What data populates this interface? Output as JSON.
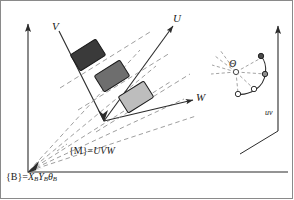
{
  "figure": {
    "background_color": "#ffffff",
    "line_color": "#2b2b2b",
    "dashed_color": "#8c8c8c",
    "border_color": "#8a8a8a",
    "width": 294,
    "height": 200
  },
  "labels": {
    "axis_v": "V",
    "axis_u": "U",
    "axis_w": "W",
    "frame_m_prefix": "{M}",
    "frame_m_equals": "=",
    "frame_m_value": "UVW",
    "frame_b_prefix": "{B}",
    "frame_b_equals": "=",
    "frame_b_x": "X",
    "frame_b_x_sub": "B",
    "frame_b_y": "Y",
    "frame_b_y_sub": "B",
    "frame_b_theta": "θ",
    "frame_b_theta_sub": "B",
    "theta_angle": "Θ",
    "inset_axis": "uv"
  },
  "base_frame": {
    "name": "{B}",
    "origin": [
      28,
      172
    ],
    "vertical_axis_tip": [
      28,
      20
    ],
    "horizontal_axis_tip": [
      286,
      172
    ],
    "fan_ray_count": 5,
    "fan_ray_endpoints": [
      [
        136,
        54
      ],
      [
        150,
        70
      ],
      [
        164,
        86
      ],
      [
        178,
        102
      ],
      [
        192,
        118
      ]
    ]
  },
  "moving_frame": {
    "name": "{M}",
    "axes": "UVW",
    "origin": [
      103,
      119
    ],
    "u_axis_tip": [
      172,
      22
    ],
    "v_axis_tip": [
      60,
      29
    ],
    "w_axis_tip": [
      196,
      101
    ],
    "corridor_dashed_lines": 3
  },
  "blocks": [
    {
      "index": 1,
      "label": "block-1",
      "fill": "#3a3a3a",
      "center": [
        88,
        55
      ],
      "width": 30,
      "height": 19,
      "rotation": -32
    },
    {
      "index": 2,
      "label": "block-2",
      "fill": "#6e6e6e",
      "center": [
        112,
        76
      ],
      "width": 30,
      "height": 19,
      "rotation": -32
    },
    {
      "index": 3,
      "label": "block-3",
      "fill": "#bdbdbd",
      "center": [
        136,
        97
      ],
      "width": 30,
      "height": 19,
      "rotation": -32
    }
  ],
  "inset": {
    "name": "theta-fan-inset",
    "hub": [
      236,
      72
    ],
    "angle_label": "Θ",
    "ray_count": 8,
    "arc_nodes": [
      {
        "index": 1,
        "center": [
          261,
          57
        ]
      },
      {
        "index": 2,
        "center": [
          265,
          74
        ]
      },
      {
        "index": 3,
        "center": [
          254,
          89
        ]
      },
      {
        "index": 4,
        "center": [
          238,
          94
        ]
      }
    ],
    "vertical_axis_base": [
      278,
      130
    ],
    "vertical_axis_tip": [
      278,
      22
    ],
    "ground_line_start": [
      278,
      130
    ],
    "ground_line_end": [
      242,
      152
    ],
    "axis_label": "uv"
  }
}
